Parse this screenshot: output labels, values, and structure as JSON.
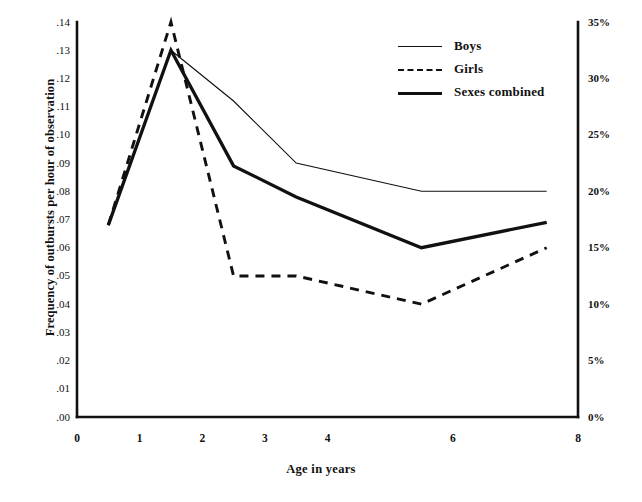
{
  "chart_data": {
    "type": "line",
    "title": "",
    "xlabel": "Age in years",
    "ylabel": "Frequency of outbursts per hour of observation",
    "ylabel_right": "",
    "xlim": [
      0,
      8
    ],
    "ylim": [
      0,
      0.14
    ],
    "ylim_right": [
      0,
      35
    ],
    "grid": false,
    "legend_position": "top-right",
    "x_ticks": [
      "0",
      "1",
      "2",
      "3",
      "4",
      "6",
      "8"
    ],
    "x_tick_values": [
      0,
      1,
      2,
      3,
      4,
      6,
      8
    ],
    "y_ticks_left": [
      ".14",
      ".13",
      ".12",
      ".11",
      ".10",
      ".09",
      ".08",
      ".07",
      ".06",
      ".05",
      ".04",
      ".03",
      ".02",
      ".01",
      ".00"
    ],
    "y_tick_values_left": [
      0.14,
      0.13,
      0.12,
      0.11,
      0.1,
      0.09,
      0.08,
      0.07,
      0.06,
      0.05,
      0.04,
      0.03,
      0.02,
      0.01,
      0.0
    ],
    "y_ticks_right": [
      "35%",
      "30%",
      "25%",
      "20%",
      "15%",
      "10%",
      "5%",
      "0%"
    ],
    "y_tick_values_right": [
      35,
      30,
      25,
      20,
      15,
      10,
      5,
      0
    ],
    "x": [
      0.5,
      1.5,
      2.5,
      3.5,
      5.5,
      7.5
    ],
    "series": [
      {
        "name": "Boys",
        "style": "solid-thin",
        "values": [
          0.068,
          0.13,
          0.112,
          0.09,
          0.08,
          0.08
        ]
      },
      {
        "name": "Girls",
        "style": "dashed",
        "values": [
          0.068,
          0.14,
          0.05,
          0.05,
          0.04,
          0.06
        ]
      },
      {
        "name": "Sexes combined",
        "style": "solid-thick",
        "values": [
          0.068,
          0.13,
          0.089,
          0.078,
          0.06,
          0.069
        ]
      }
    ]
  },
  "legend": {
    "entries": [
      {
        "label": "Boys",
        "swatch": "thin-solid-line-icon"
      },
      {
        "label": "Girls",
        "swatch": "dashed-line-icon"
      },
      {
        "label": "Sexes combined",
        "swatch": "thick-solid-line-icon"
      }
    ]
  },
  "colors": {
    "ink": "#111111",
    "background": "#ffffff"
  }
}
